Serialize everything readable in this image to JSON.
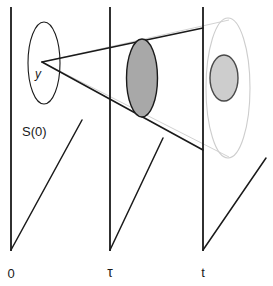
{
  "figure": {
    "background_color": "#ffffff",
    "line_color": "#1a1a1a",
    "faint_line_color": "#c9c9c9",
    "mid_disk_fill": "#a8a8a8",
    "right_disk_fill": "#cdcdcd",
    "labels": {
      "initial_point": "y",
      "initial_set": "S(0)",
      "axis_time_zero": "0",
      "axis_time_tau": "τ",
      "axis_time_t": "t"
    },
    "time_axes": [
      {
        "name": "time-axis-0",
        "label": "0",
        "x": 11,
        "top_y": 8,
        "bottom_y": 250
      },
      {
        "name": "time-axis-tau",
        "label": "τ",
        "x": 110,
        "top_y": 8,
        "bottom_y": 250
      },
      {
        "name": "time-axis-t",
        "label": "t",
        "x": 203,
        "top_y": 8,
        "bottom_y": 250
      }
    ],
    "slice_planes": [
      {
        "name": "plane-0",
        "diagonal": "11,250 82,120"
      },
      {
        "name": "plane-tau",
        "diagonal": "110,250 163,138"
      },
      {
        "name": "plane-t",
        "diagonal": "203,250 266,158"
      }
    ],
    "ellipses": [
      {
        "name": "initial-set-ellipse",
        "cx": 44,
        "cy": 63,
        "rx": 16,
        "ry": 41,
        "fill": "none",
        "stroke": "#1a1a1a",
        "stroke_width": 1.1
      },
      {
        "name": "tau-reachable-disk",
        "cx": 142,
        "cy": 78,
        "rx": 15.5,
        "ry": 39,
        "fill": "#a8a8a8",
        "stroke": "#1a1a1a",
        "stroke_width": 1.3
      },
      {
        "name": "t-outer-ellipse",
        "cx": 228,
        "cy": 88,
        "rx": 22,
        "ry": 70,
        "fill": "none",
        "stroke": "#cdcdcd",
        "stroke_width": 1.1
      },
      {
        "name": "t-reachable-disk",
        "cx": 224,
        "cy": 78,
        "rx": 14,
        "ry": 23,
        "fill": "#cdcdcd",
        "stroke": "#4a4a4a",
        "stroke_width": 1.3
      }
    ],
    "cone": {
      "name": "reachability-cone",
      "apex": {
        "x": 42,
        "y": 62
      },
      "upper_edge": "42,62 203,28",
      "lower_edge": "42,62 203,150",
      "faint_upper_edge": "42,62 228,20",
      "faint_lower_edge": "42,62 228,157"
    }
  }
}
